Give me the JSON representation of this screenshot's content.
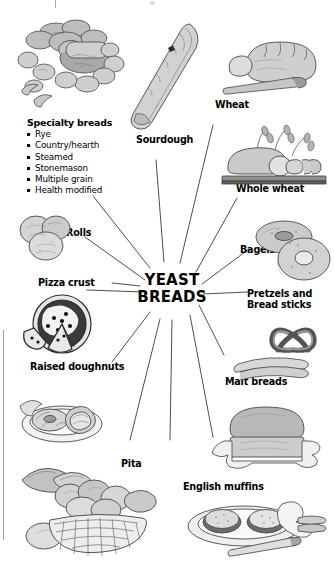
{
  "diagram": {
    "type": "radial-spoke",
    "title": "Yeast Breads",
    "hub": {
      "line1": "YEAST",
      "line2": "BREADS"
    },
    "spokes": [
      {
        "id": "specialty-breads",
        "label": "Specialty breads",
        "position": "left-top",
        "sublist": [
          "Rye",
          "Country/hearth",
          "Steamed",
          "Stonemason",
          "Multiple grain",
          "Health modified"
        ]
      },
      {
        "id": "sourdough",
        "label": "Sourdough",
        "position": "top-center"
      },
      {
        "id": "wheat",
        "label": "Wheat",
        "position": "top-right"
      },
      {
        "id": "whole-wheat",
        "label": "Whole wheat",
        "position": "right-top"
      },
      {
        "id": "bagels",
        "label": "Bagels",
        "position": "right"
      },
      {
        "id": "pretzels-bread-sticks",
        "label_line1": "Pretzels and",
        "label_line2": "Bread sticks",
        "position": "right-lower"
      },
      {
        "id": "malt-breads",
        "label": "Malt breads",
        "position": "right-bottom"
      },
      {
        "id": "english-muffins",
        "label": "English muffins",
        "position": "bottom-right"
      },
      {
        "id": "pita",
        "label": "Pita",
        "position": "bottom-center"
      },
      {
        "id": "raised-doughnuts",
        "label": "Raised doughnuts",
        "position": "left-bottom"
      },
      {
        "id": "pizza-crust",
        "label": "Pizza crust",
        "position": "left-lower"
      },
      {
        "id": "rolls",
        "label": "Rolls",
        "position": "left"
      }
    ],
    "colors": {
      "text": "#000000",
      "line": "#333333",
      "illustration_ink": "#4a4a4a",
      "illustration_fill": "#c9c9c9",
      "background": "#ffffff"
    }
  }
}
